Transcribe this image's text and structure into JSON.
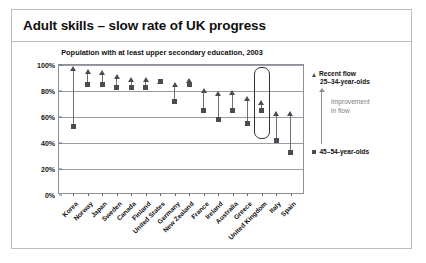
{
  "slide": {
    "title": "Adult skills – slow rate of UK progress"
  },
  "legend": {
    "recent_flow_label": "Recent flow",
    "recent_flow_sub": "25–34-year-olds",
    "improvement_line1": "Improvement",
    "improvement_line2": "in flow",
    "older_label": "45–54-year-olds",
    "marker_recent": "triangle",
    "marker_older": "square"
  },
  "highlight": {
    "country": "United Kingdom",
    "shape": "rounded-rectangle"
  },
  "colors": {
    "marker": "#4a4c51",
    "connector": "#6e7075",
    "gridline": "#9a9da3",
    "frame": "#8d9097",
    "slide_border": "#b9bcc2",
    "highlight_box": "#2f3135",
    "muted_text": "#7c7f85"
  },
  "chart_data": {
    "type": "scatter",
    "title": "Population with at least upper secondary education, 2003",
    "xlabel": "",
    "ylabel": "",
    "ylim": [
      0,
      100
    ],
    "yticks": [
      "0%",
      "20%",
      "40%",
      "60%",
      "80%",
      "100%"
    ],
    "ytick_values": [
      0,
      20,
      40,
      60,
      80,
      100
    ],
    "grid": true,
    "legend_position": "right",
    "categories": [
      "Korea",
      "Norway",
      "Japan",
      "Sweden",
      "Canada",
      "Finland",
      "United States",
      "Germany",
      "New Zealand",
      "France",
      "Ireland",
      "Australia",
      "Greece",
      "United Kingdom",
      "Italy",
      "Spain"
    ],
    "series": [
      {
        "name": "Recent flow 25–34-year-olds",
        "marker": "triangle",
        "values": [
          97,
          95,
          94,
          91,
          89,
          89,
          87,
          85,
          88,
          80,
          78,
          79,
          74,
          71,
          63,
          63
        ]
      },
      {
        "name": "45–54-year-olds",
        "marker": "square",
        "values": [
          53,
          85,
          85,
          83,
          83,
          83,
          87,
          72,
          85,
          65,
          58,
          65,
          55,
          65,
          42,
          33
        ]
      }
    ]
  }
}
